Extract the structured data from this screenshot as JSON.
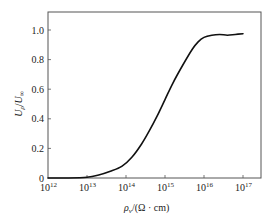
{
  "chart_data": {
    "type": "line",
    "title": "",
    "xlabel": "ρ_v/(Ω·cm)",
    "xlabel_parts": {
      "symbol": "ρ",
      "subscript": "v",
      "unit": "/(Ω · cm)"
    },
    "ylabel": "U_ρ/U_∞",
    "ylabel_parts": {
      "num": "U",
      "num_sub": "ρ",
      "slash": "/",
      "den": "U",
      "den_sub": "∞"
    },
    "xscale": "log",
    "xlim": [
      1000000000000.0,
      5e+17
    ],
    "ylim": [
      0,
      1.12
    ],
    "x_ticks": [
      {
        "exp": 12,
        "base": "10",
        "sup": "12"
      },
      {
        "exp": 13,
        "base": "10",
        "sup": "13"
      },
      {
        "exp": 14,
        "base": "10",
        "sup": "14"
      },
      {
        "exp": 15,
        "base": "10",
        "sup": "15"
      },
      {
        "exp": 16,
        "base": "10",
        "sup": "16"
      },
      {
        "exp": 17,
        "base": "10",
        "sup": "17"
      }
    ],
    "y_ticks": [
      {
        "value": 0,
        "label": "0"
      },
      {
        "value": 0.2,
        "label": "0.2"
      },
      {
        "value": 0.4,
        "label": "0.4"
      },
      {
        "value": 0.6,
        "label": "0.6"
      },
      {
        "value": 0.8,
        "label": "0.8"
      },
      {
        "value": 1.0,
        "label": "1.0"
      }
    ],
    "grid": false,
    "legend": null,
    "series": [
      {
        "name": "U_ρ/U_∞",
        "color": "#111111",
        "log10_x": [
          12.0,
          12.5,
          13.0,
          13.3,
          13.6,
          13.9,
          14.15,
          14.4,
          14.6,
          14.8,
          15.0,
          15.2,
          15.45,
          15.7,
          15.85,
          16.0,
          16.2,
          16.4,
          16.6,
          16.8,
          17.0
        ],
        "y": [
          0.0,
          0.0,
          0.005,
          0.02,
          0.045,
          0.08,
          0.14,
          0.23,
          0.32,
          0.42,
          0.53,
          0.64,
          0.76,
          0.87,
          0.92,
          0.95,
          0.965,
          0.97,
          0.965,
          0.97,
          0.975
        ]
      }
    ]
  }
}
